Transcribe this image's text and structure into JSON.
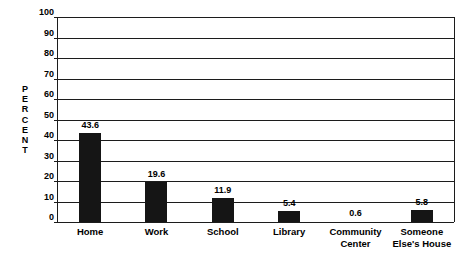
{
  "chart_data": {
    "type": "bar",
    "title": "",
    "xlabel": "",
    "ylabel": "PERCENT",
    "ylabel_letters": [
      "P",
      "E",
      "R",
      "C",
      "E",
      "N",
      "T"
    ],
    "categories": [
      "Home",
      "Work",
      "School",
      "Library",
      "Community Center",
      "Someone Else's House"
    ],
    "category_lines": [
      [
        "Home"
      ],
      [
        "Work"
      ],
      [
        "School"
      ],
      [
        "Library"
      ],
      [
        "Community",
        "Center"
      ],
      [
        "Someone",
        "Else's House"
      ]
    ],
    "values": [
      43.6,
      19.6,
      11.9,
      5.4,
      0.6,
      5.8
    ],
    "value_labels": [
      "43.6",
      "19.6",
      "11.9",
      "5.4",
      "0.6",
      "5.8"
    ],
    "ylim": [
      0,
      100
    ],
    "ytick_step": 10,
    "ytick_labels": [
      "100",
      "90",
      "80",
      "70",
      "60",
      "50",
      "40",
      "30",
      "20",
      "10",
      "0"
    ],
    "ytick_values": [
      100,
      90,
      80,
      70,
      60,
      50,
      40,
      30,
      20,
      10,
      0
    ],
    "grid": true,
    "grid_axis": "y",
    "legend": false,
    "bar_color": "#151515",
    "axis_color": "#1c1c1c",
    "background_color": "#ffffff"
  }
}
